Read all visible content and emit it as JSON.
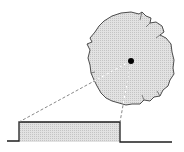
{
  "diagram": {
    "description": "Jagged circular disk with center point; dashed projection lines from center down to a rectangular pulse",
    "colors": {
      "background": "#ffffff",
      "fill": "#d9d9d9",
      "stroke": "#2a2a2a",
      "center_dot": "#000000",
      "dash_outside": "#7a7a7a",
      "dash_inside": "#ffffff"
    },
    "disk": {
      "cx": 131,
      "cy": 60,
      "r": 44
    },
    "center_point": {
      "x": 131,
      "y": 61,
      "r": 3
    },
    "pulse": {
      "baseline_y": 142,
      "top_y": 122,
      "x_start": 7,
      "rise_x": 19,
      "fall_x": 120,
      "x_end": 172
    },
    "projection_lines": [
      {
        "from": [
          131,
          61
        ],
        "to": [
          19,
          122
        ]
      },
      {
        "from": [
          131,
          61
        ],
        "to": [
          120,
          122
        ]
      }
    ]
  }
}
